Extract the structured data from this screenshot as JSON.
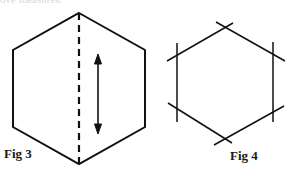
{
  "header_text": "ove measures.",
  "figures": [
    {
      "label": "Fig 3",
      "description": "Hexagon with dashed vertical fold line through top and bottom vertices and a double-headed vertical arrow"
    },
    {
      "label": "Fig 4",
      "description": "Hexagon with extended crossing lines at each vertex"
    }
  ],
  "colors": {
    "line": "#111111",
    "background": "#ffffff"
  }
}
